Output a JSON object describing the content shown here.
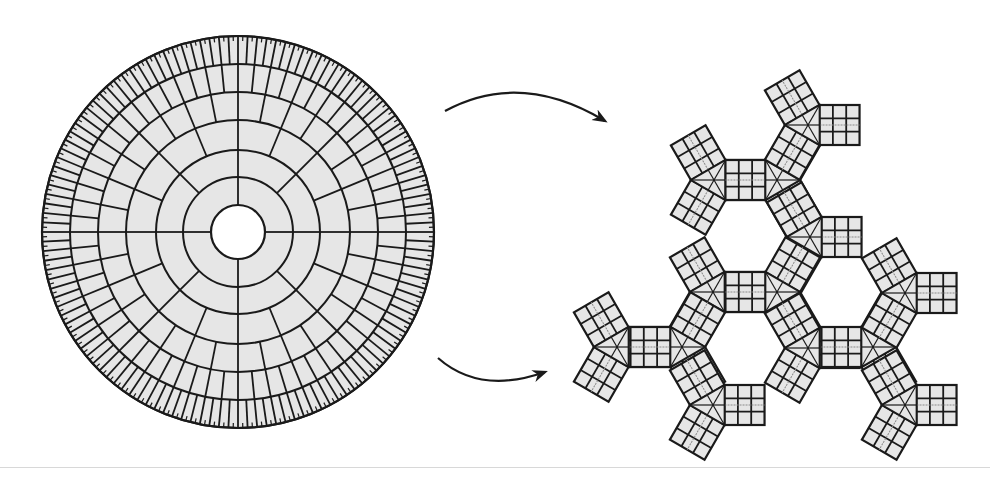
{
  "figure": {
    "background": "#ffffff",
    "line_color": "#1a1a1a",
    "cell_fill": "#e6e6e6",
    "hole_fill": "#ffffff"
  },
  "polar_mesh": {
    "center": [
      238,
      232
    ],
    "outer_radius": 196,
    "hole_radius": 27,
    "rings": [
      {
        "r_inner": 27,
        "r_outer": 55,
        "segments": 4
      },
      {
        "r_inner": 55,
        "r_outer": 82,
        "segments": 8
      },
      {
        "r_inner": 82,
        "r_outer": 112,
        "segments": 16
      },
      {
        "r_inner": 112,
        "r_outer": 140,
        "segments": 32
      },
      {
        "r_inner": 140,
        "r_outer": 168,
        "segments": 64
      },
      {
        "r_inner": 168,
        "r_outer": 196,
        "segments": 128
      }
    ],
    "tick_count": 256
  },
  "arrows": [
    {
      "name": "arrow-top",
      "from": [
        445,
        111
      ],
      "ctrl": [
        520,
        70
      ],
      "to": [
        605,
        121
      ]
    },
    {
      "name": "arrow-bottom",
      "from": [
        438,
        358
      ],
      "ctrl": [
        480,
        395
      ],
      "to": [
        545,
        372
      ]
    }
  ],
  "junction_network": {
    "arm_length": 40,
    "arm_width": 40,
    "cells_per_arm": 3,
    "junctions": [
      {
        "id": "J1",
        "center": [
          714,
          180
        ],
        "angles": [
          0,
          120,
          240
        ]
      },
      {
        "id": "J2",
        "center": [
          777,
          180
        ],
        "angles": [
          180,
          300,
          60
        ]
      },
      {
        "id": "J3",
        "center": [
          808,
          125
        ],
        "angles": [
          0,
          120,
          240
        ]
      },
      {
        "id": "J4",
        "center": [
          810,
          237
        ],
        "angles": [
          0,
          120,
          240
        ]
      },
      {
        "id": "J5",
        "center": [
          713,
          292
        ],
        "angles": [
          0,
          120,
          240
        ]
      },
      {
        "id": "J6",
        "center": [
          777,
          292
        ],
        "angles": [
          180,
          300,
          60
        ]
      },
      {
        "id": "J7",
        "center": [
          617,
          347
        ],
        "angles": [
          0,
          120,
          240
        ]
      },
      {
        "id": "J8",
        "center": [
          682,
          347
        ],
        "angles": [
          180,
          300,
          60
        ]
      },
      {
        "id": "J9",
        "center": [
          808,
          348
        ],
        "angles": [
          0,
          120,
          240
        ]
      },
      {
        "id": "J10",
        "center": [
          873,
          347
        ],
        "angles": [
          180,
          300,
          60
        ]
      },
      {
        "id": "J11",
        "center": [
          905,
          293
        ],
        "angles": [
          0,
          120,
          240
        ]
      },
      {
        "id": "J12",
        "center": [
          713,
          405
        ],
        "angles": [
          0,
          120,
          240
        ]
      },
      {
        "id": "J13",
        "center": [
          905,
          405
        ],
        "angles": [
          0,
          120,
          240
        ]
      }
    ]
  }
}
